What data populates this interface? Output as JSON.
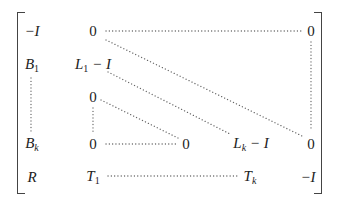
{
  "matrix": {
    "rows": [
      [
        "−I",
        "0",
        "",
        "",
        "0"
      ],
      [
        "B₁",
        "L₁ − I",
        "",
        "",
        ""
      ],
      [
        "",
        "0",
        "",
        "",
        ""
      ],
      [
        "Bₖ",
        "0",
        "0",
        "Lₖ − I",
        "0"
      ],
      [
        "R",
        "T₁",
        "",
        "Tₖ",
        "−I"
      ]
    ],
    "entries": {
      "r1c1": {
        "base": "−I"
      },
      "r1c2": {
        "base": "0"
      },
      "r1c5": {
        "base": "0"
      },
      "r2c1": {
        "base": "B",
        "sub": "1"
      },
      "r2c2": {
        "base": "L",
        "sub": "1",
        "tail": " − I"
      },
      "r3c2": {
        "base": "0"
      },
      "r4c1": {
        "base": "B",
        "sub": "k"
      },
      "r4c2": {
        "base": "0"
      },
      "r4c3": {
        "base": "0"
      },
      "r4c4": {
        "base": "L",
        "sub": "k",
        "tail": " − I"
      },
      "r4c5": {
        "base": "0"
      },
      "r5c1": {
        "base": "R"
      },
      "r5c2": {
        "base": "T",
        "sub": "1"
      },
      "r5c4": {
        "base": "T",
        "sub": "k"
      },
      "r5c5": {
        "base": "−I"
      }
    },
    "ellipses": [
      "row1: 0 … 0 (horizontal)",
      "col5: 0 ⋮ 0 (vertical)",
      "diagonal from row1 0 to row4 col5 0",
      "diagonal from L₁ − I to Lₖ − I",
      "col1: B₁ ⋮ Bₖ (vertical)",
      "col2: 0 ⋮ 0 (vertical)",
      "diagonal from row3 0 to row4 col3 0",
      "row4: 0 … 0 (horizontal)",
      "row5: T₁ … Tₖ (horizontal)"
    ]
  }
}
